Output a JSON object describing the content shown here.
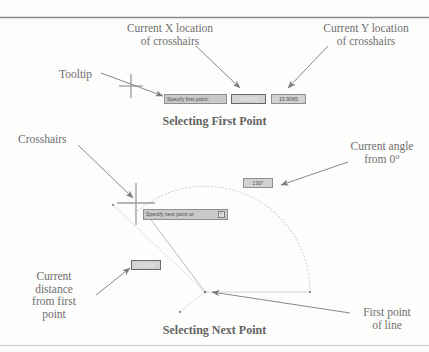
{
  "figure": {
    "title_top_rule": true,
    "title_bottom_rule": true
  },
  "panels": [
    {
      "caption": "Selecting First Point",
      "annotations": [
        {
          "name": "tooltip",
          "text": "Tooltip"
        },
        {
          "name": "current-x",
          "text": "Current X location\nof crosshairs"
        },
        {
          "name": "current-y",
          "text": "Current Y location\nof crosshairs"
        }
      ],
      "tooltips": [
        {
          "name": "prompt",
          "label": "Specify first point:",
          "state": "normal"
        },
        {
          "name": "x-value",
          "label": "10.8510",
          "state": "highlighted"
        },
        {
          "name": "y-value",
          "label": "13.9065",
          "state": "field"
        }
      ]
    },
    {
      "caption": "Selecting Next Point",
      "annotations": [
        {
          "name": "crosshairs",
          "text": "Crosshairs"
        },
        {
          "name": "current-angle",
          "text": "Current angle\nfrom 0°"
        },
        {
          "name": "current-distance",
          "text": "Current\ndistance\nfrom first\npoint"
        },
        {
          "name": "first-point",
          "text": "First point\nof line"
        }
      ],
      "tooltips": [
        {
          "name": "prompt",
          "label": "Specify next point or",
          "state": "normal",
          "dropdown": true
        },
        {
          "name": "angle-value",
          "label": "130°",
          "state": "field"
        },
        {
          "name": "distance-value",
          "label": "5.1816",
          "state": "highlighted"
        }
      ]
    }
  ],
  "labels": {
    "tooltip": "Tooltip",
    "current_x_l1": "Current X location",
    "current_x_l2": "of crosshairs",
    "current_y_l1": "Current Y location",
    "current_y_l2": "of crosshairs",
    "caption_first": "Selecting First Point",
    "crosshairs": "Crosshairs",
    "current_angle_l1": "Current angle",
    "current_angle_l2": "from 0°",
    "current_distance_l1": "Current",
    "current_distance_l2": "distance",
    "current_distance_l3": "from first",
    "current_distance_l4": "point",
    "first_point_l1": "First point",
    "first_point_l2": "of line",
    "caption_next": "Selecting Next Point"
  },
  "tips": {
    "specify_first_point": "Specify first point:",
    "x_value": "10.8510",
    "y_value": "13.9065",
    "specify_next_point": "Specify next point or",
    "angle_value": "130°",
    "distance_value": "5.1816"
  },
  "colors": {
    "ink": "#6f6f6f",
    "rule": "#8c8c8c",
    "tip_bg": "#c9c9c9",
    "tip_highlight_bg": "#7c7c7c",
    "crosshair": "#9a9a9a",
    "arc": "#c6c6c6"
  }
}
